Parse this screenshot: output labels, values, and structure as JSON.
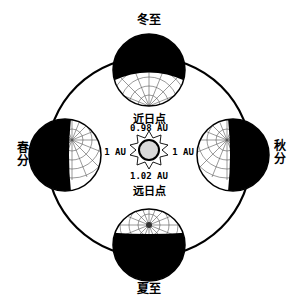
{
  "diagram": {
    "type": "earth-orbit-seasons",
    "colors": {
      "line": "#000000",
      "night": "#000000",
      "day": "#ffffff",
      "sun": "#d9d9d9",
      "grid": "#555555"
    },
    "seasons": {
      "winter_solstice": "冬至",
      "summer_solstice": "夏至",
      "spring_equinox_top": "春",
      "spring_equinox_bottom": "分",
      "autumn_equinox_top": "秋",
      "autumn_equinox_bottom": "分"
    },
    "sun": {
      "perihelion_label": "近日点",
      "perihelion_distance": "0.98 AU",
      "aphelion_distance": "1.02 AU",
      "aphelion_label": "远日点",
      "left_distance": "1 AU",
      "right_distance": "1 AU"
    }
  }
}
